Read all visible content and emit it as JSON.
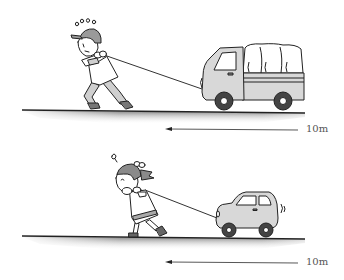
{
  "scenes": [
    {
      "id": "man-truck",
      "puller": "man",
      "vehicle": "truck",
      "distance_label": "10m",
      "arrow_direction": "left"
    },
    {
      "id": "girl-car",
      "puller": "girl",
      "vehicle": "car",
      "distance_label": "10m",
      "arrow_direction": "left"
    }
  ],
  "colors": {
    "line": "#222222",
    "vehicle_fill": "#d8d8d8",
    "clothes_fill": "#cfcfcf",
    "skin_fill": "#ffffff",
    "hair_fill": "#8a8a8a",
    "cap_fill": "#9a9a9a"
  }
}
